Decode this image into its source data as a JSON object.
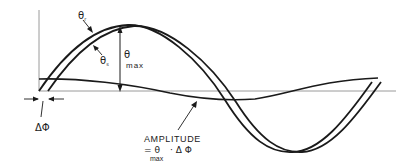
{
  "figure": {
    "labels": {
      "theta_r": "θ",
      "theta_r_sub": "r",
      "theta_s": "θ",
      "theta_s_sub": "s",
      "theta_max": "θ",
      "theta_max_sub": "max",
      "delta_phi": "ΔΦ",
      "amplitude_title": "AMPLITUDE",
      "amplitude_eq_prefix": "= θ",
      "amplitude_eq_sub": "max",
      "amplitude_eq_suffix": "· Δ Φ"
    },
    "colors": {
      "curve": "#1a1a1a",
      "baseline": "#9a9a9a",
      "background": "#ffffff"
    }
  }
}
